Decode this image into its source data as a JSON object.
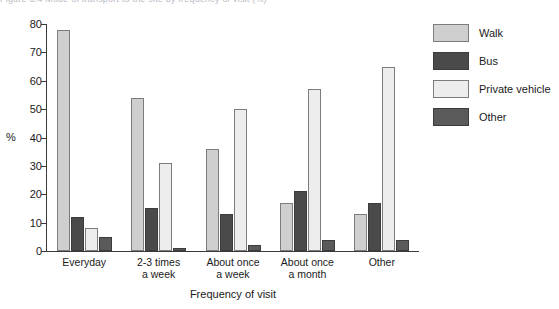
{
  "top_bleed_text": "Figure 3.4  Mode of transport to the site by frequency of visit (%)",
  "chart_data": {
    "type": "bar",
    "title": "",
    "subtitle": "",
    "xlabel": "Frequency of visit",
    "ylabel": "%",
    "ylim": [
      0,
      80
    ],
    "ytick_step": 10,
    "yticks": [
      80,
      70,
      60,
      50,
      40,
      30,
      20,
      10,
      0
    ],
    "grid": false,
    "legend_position": "right",
    "categories": [
      "Everyday",
      "2-3 times\na week",
      "About once\na week",
      "About once\na month",
      "Other"
    ],
    "series": [
      {
        "name": "Walk",
        "color": "#cfcfcf",
        "values": [
          78,
          54,
          36,
          17,
          13
        ]
      },
      {
        "name": "Bus",
        "color": "#4a4a4a",
        "values": [
          12,
          15,
          13,
          21,
          17
        ]
      },
      {
        "name": "Private vehicle",
        "color": "#ededed",
        "values": [
          8,
          31,
          50,
          57,
          65
        ]
      },
      {
        "name": "Other",
        "color": "#5a5a5a",
        "values": [
          5,
          1,
          2,
          4,
          4
        ]
      }
    ]
  }
}
